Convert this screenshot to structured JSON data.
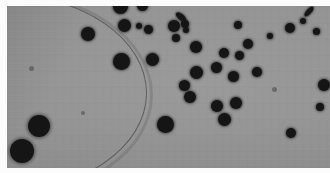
{
  "figure": {
    "kind": "micrograph",
    "caption": "",
    "modality": "grayscale-photograph",
    "background_color": "#949494",
    "colony_color": "#151515",
    "border_color": "#fcfcfc",
    "plate": {
      "x": 7,
      "y": 6,
      "width": 323,
      "height": 162
    },
    "dish_rim": {
      "present": true,
      "location": "upper-left",
      "description": "thin dark curved arc of dish wall sweeping from left edge to top edge"
    },
    "colonies": [
      {
        "cx": 121,
        "cy": 8,
        "r": 7.5,
        "shape": "round"
      },
      {
        "cx": 143,
        "cy": 7,
        "r": 5.5,
        "shape": "round"
      },
      {
        "cx": 88,
        "cy": 34,
        "r": 7.0,
        "shape": "round"
      },
      {
        "cx": 124,
        "cy": 25,
        "r": 6.5,
        "shape": "round"
      },
      {
        "cx": 139,
        "cy": 26,
        "r": 3.0,
        "shape": "round"
      },
      {
        "cx": 149,
        "cy": 29,
        "r": 4.5,
        "shape": "round"
      },
      {
        "cx": 174,
        "cy": 26,
        "r": 6.0,
        "shape": "round"
      },
      {
        "cx": 185,
        "cy": 24,
        "r": 4.0,
        "shape": "round"
      },
      {
        "cx": 176,
        "cy": 38,
        "r": 4.0,
        "shape": "round"
      },
      {
        "cx": 196,
        "cy": 47,
        "r": 6.0,
        "shape": "round"
      },
      {
        "cx": 122,
        "cy": 62,
        "r": 8.5,
        "shape": "round"
      },
      {
        "cx": 152,
        "cy": 60,
        "r": 6.5,
        "shape": "round"
      },
      {
        "cx": 186,
        "cy": 30,
        "r": 3.0,
        "shape": "round"
      },
      {
        "cx": 181,
        "cy": 20,
        "r": 5.0,
        "shape": "streak"
      },
      {
        "cx": 238,
        "cy": 27,
        "r": 4.0,
        "shape": "round"
      },
      {
        "cx": 248,
        "cy": 46,
        "r": 5.0,
        "shape": "round"
      },
      {
        "cx": 240,
        "cy": 58,
        "r": 4.5,
        "shape": "round"
      },
      {
        "cx": 270,
        "cy": 38,
        "r": 3.0,
        "shape": "round"
      },
      {
        "cx": 290,
        "cy": 30,
        "r": 5.0,
        "shape": "round"
      },
      {
        "cx": 308,
        "cy": 14,
        "r": 5.0,
        "shape": "streak"
      },
      {
        "cx": 316,
        "cy": 33,
        "r": 3.5,
        "shape": "round"
      },
      {
        "cx": 303,
        "cy": 22,
        "r": 3.0,
        "shape": "round"
      },
      {
        "cx": 222,
        "cy": 54,
        "r": 5.0,
        "shape": "round"
      },
      {
        "cx": 215,
        "cy": 69,
        "r": 5.5,
        "shape": "round"
      },
      {
        "cx": 196,
        "cy": 73,
        "r": 6.5,
        "shape": "round"
      },
      {
        "cx": 232,
        "cy": 77,
        "r": 5.5,
        "shape": "round"
      },
      {
        "cx": 257,
        "cy": 72,
        "r": 5.0,
        "shape": "round"
      },
      {
        "cx": 190,
        "cy": 97,
        "r": 6.0,
        "shape": "round"
      },
      {
        "cx": 217,
        "cy": 106,
        "r": 6.0,
        "shape": "round"
      },
      {
        "cx": 236,
        "cy": 103,
        "r": 6.0,
        "shape": "round"
      },
      {
        "cx": 224,
        "cy": 120,
        "r": 6.5,
        "shape": "round"
      },
      {
        "cx": 165,
        "cy": 125,
        "r": 8.5,
        "shape": "round"
      },
      {
        "cx": 291,
        "cy": 133,
        "r": 5.0,
        "shape": "round"
      },
      {
        "cx": 318,
        "cy": 107,
        "r": 4.0,
        "shape": "round"
      },
      {
        "cx": 322,
        "cy": 85,
        "r": 6.0,
        "shape": "round"
      },
      {
        "cx": 39,
        "cy": 127,
        "r": 11.0,
        "shape": "round"
      },
      {
        "cx": 22,
        "cy": 151,
        "r": 12.0,
        "shape": "round"
      },
      {
        "cx": 184,
        "cy": 86,
        "r": 5.5,
        "shape": "round"
      },
      {
        "cx": 275,
        "cy": 90,
        "r": 3.0,
        "shape": "speck"
      },
      {
        "cx": 82,
        "cy": 113,
        "r": 2.0,
        "shape": "speck"
      },
      {
        "cx": 31,
        "cy": 68,
        "r": 2.5,
        "shape": "speck"
      }
    ],
    "colony_count_visible": 41
  }
}
